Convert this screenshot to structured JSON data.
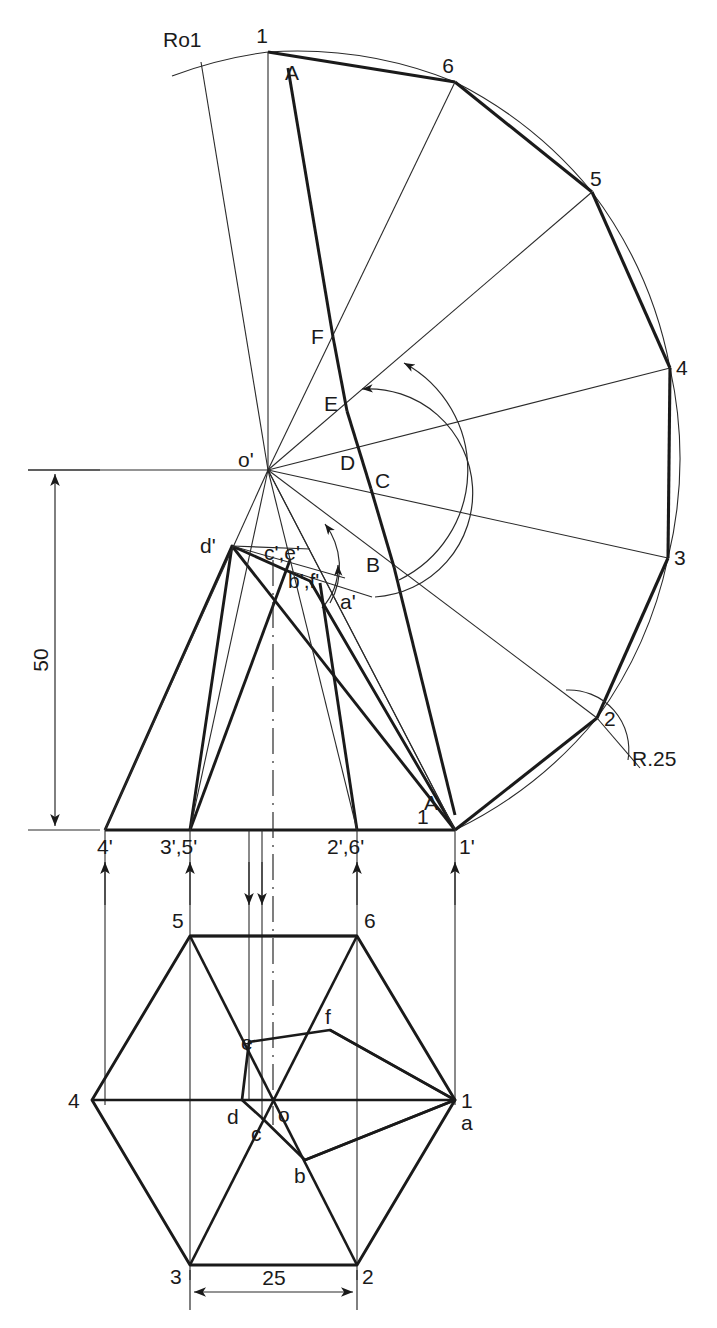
{
  "drawing": {
    "title": "Development of a hexagonal pyramid with cutting plane",
    "type": "engineering-orthographic-projection"
  },
  "dimensions": {
    "height_label": "50",
    "width_label": "25",
    "radius_label": "R.25",
    "true_length_label": "Ro1"
  },
  "development": {
    "apex_label": "o'",
    "arc_points": [
      "1",
      "6",
      "5",
      "4",
      "3",
      "2",
      "1"
    ],
    "cut_points": [
      "A",
      "F",
      "E",
      "D",
      "C",
      "B",
      "A"
    ],
    "points": [
      {
        "label": "1",
        "x": 268,
        "y": 52
      },
      {
        "label": "6",
        "x": 455,
        "y": 82
      },
      {
        "label": "5",
        "x": 592,
        "y": 192
      },
      {
        "label": "4",
        "x": 670,
        "y": 368
      },
      {
        "label": "3",
        "x": 668,
        "y": 558
      },
      {
        "label": "2",
        "x": 597,
        "y": 718
      },
      {
        "label": "1",
        "x": 455,
        "y": 830
      }
    ],
    "cut_vertices": [
      {
        "label": "A",
        "x": 288,
        "y": 70
      },
      {
        "label": "F",
        "x": 333,
        "y": 337
      },
      {
        "label": "E",
        "x": 335,
        "y": 404
      },
      {
        "label": "D",
        "x": 343,
        "y": 463
      },
      {
        "label": "C",
        "x": 382,
        "y": 478
      },
      {
        "label": "B",
        "x": 372,
        "y": 564
      },
      {
        "label": "A",
        "x": 455,
        "y": 800
      }
    ]
  },
  "front_view": {
    "base_labels": [
      "4'",
      "3',5'",
      "2',6'",
      "1'"
    ],
    "base_points": [
      {
        "label": "4'",
        "x": 105,
        "y": 830
      },
      {
        "label": "3',5'",
        "x": 190,
        "y": 830
      },
      {
        "label": "2',6'",
        "x": 357,
        "y": 830
      },
      {
        "label": "1'",
        "x": 455,
        "y": 830
      }
    ],
    "apex_label": "o'",
    "section_labels": [
      "d'",
      "c',e'",
      "b',f'",
      "a'"
    ],
    "section_points": [
      {
        "label": "d'",
        "x": 232,
        "y": 546
      },
      {
        "label": "c',e'",
        "x": 290,
        "y": 553
      },
      {
        "label": "b',f'",
        "x": 310,
        "y": 581
      },
      {
        "label": "a'",
        "x": 355,
        "y": 600
      }
    ],
    "edge_number_label": "1",
    "edge_letter_label": "A"
  },
  "top_view": {
    "hexagon_labels": [
      "1",
      "2",
      "3",
      "4",
      "5",
      "6"
    ],
    "hexagon_points": [
      {
        "label": "1",
        "x": 455,
        "y": 1100
      },
      {
        "label": "2",
        "x": 357,
        "y": 1265
      },
      {
        "label": "3",
        "x": 190,
        "y": 1265
      },
      {
        "label": "4",
        "x": 92,
        "y": 1100
      },
      {
        "label": "5",
        "x": 190,
        "y": 936
      },
      {
        "label": "6",
        "x": 357,
        "y": 936
      }
    ],
    "center_label": "o",
    "section_labels": [
      "a",
      "b",
      "c",
      "d",
      "e",
      "f"
    ],
    "section_points": [
      {
        "label": "a",
        "x": 455,
        "y": 1100
      },
      {
        "label": "b",
        "x": 305,
        "y": 1160
      },
      {
        "label": "c",
        "x": 262,
        "y": 1118
      },
      {
        "label": "d",
        "x": 242,
        "y": 1100
      },
      {
        "label": "e",
        "x": 249,
        "y": 1042
      },
      {
        "label": "f",
        "x": 330,
        "y": 1030
      }
    ]
  },
  "colors": {
    "line": "#1a1a1a",
    "thin": "#2a2a2a",
    "background": "#ffffff"
  }
}
